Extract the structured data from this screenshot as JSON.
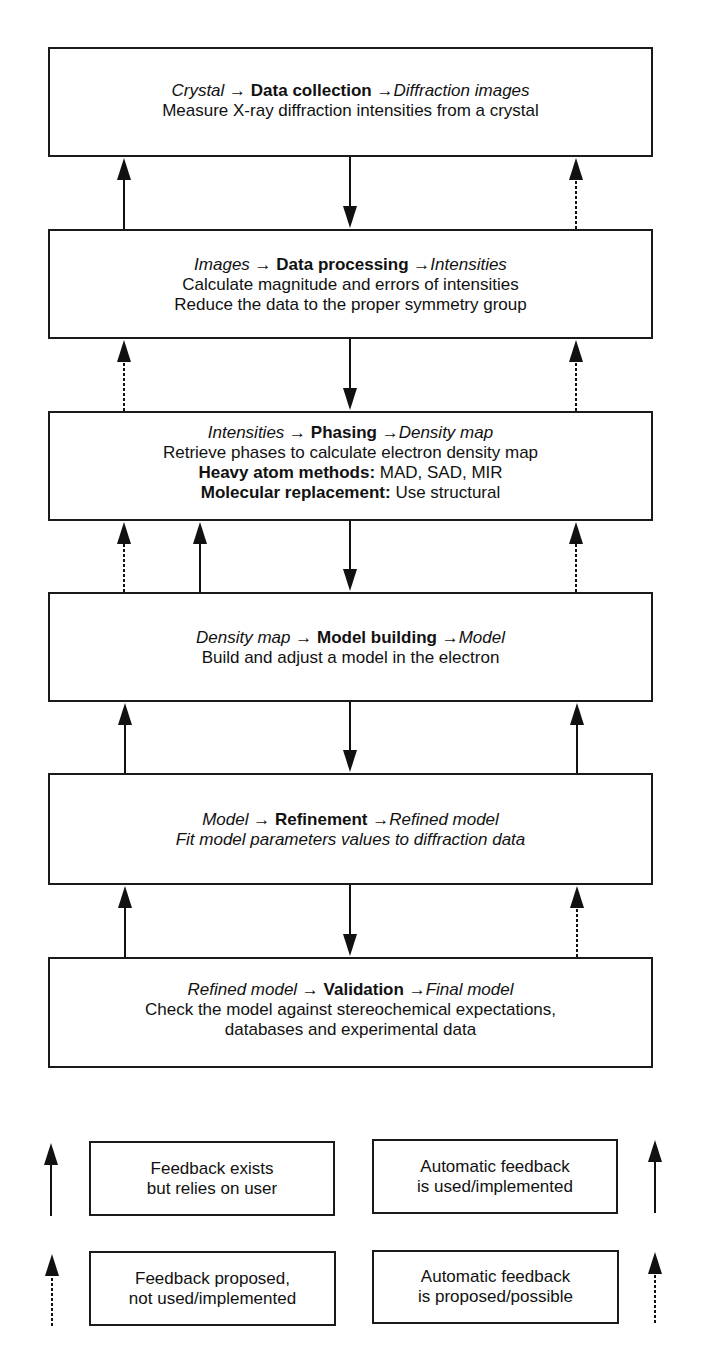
{
  "stages": [
    {
      "input": "Crystal",
      "name": "Data collection",
      "output": "Diffraction images",
      "arrow": "→",
      "lines": [
        {
          "text": "Measure X-ray diffraction intensities from a crystal",
          "style": "normal"
        }
      ]
    },
    {
      "input": "Images",
      "name": "Data processing",
      "output": "Intensities",
      "arrow": "→",
      "lines": [
        {
          "text": "Calculate magnitude and errors of intensities",
          "style": "normal"
        },
        {
          "text": "Reduce the data to the proper symmetry group",
          "style": "normal"
        }
      ]
    },
    {
      "input": "Intensities",
      "name": "Phasing",
      "output": "Density map",
      "arrow": "→",
      "lines": [
        {
          "text": "Retrieve phases to calculate electron density map",
          "style": "normal"
        },
        {
          "label": "Heavy atom methods:",
          "text": " MAD, SAD, MIR",
          "style": "labeled"
        },
        {
          "label": "Molecular replacement:",
          "text": " Use structural",
          "style": "labeled"
        }
      ]
    },
    {
      "input": "Density map",
      "name": "Model building",
      "output": "Model",
      "arrow": "→",
      "lines": [
        {
          "text": "Build and adjust a model in the electron",
          "style": "normal"
        }
      ]
    },
    {
      "input": "Model",
      "name": "Refinement",
      "output": "Refined model",
      "arrow": "→",
      "lines": [
        {
          "text": "Fit model parameters values to diffraction data",
          "style": "italic"
        }
      ]
    },
    {
      "input": "Refined model",
      "name": "Validation",
      "output": "Final model",
      "arrow": "→",
      "lines": [
        {
          "text": "Check the model against stereochemical expectations,",
          "style": "normal"
        },
        {
          "text": "databases and experimental data",
          "style": "normal"
        }
      ]
    }
  ],
  "feedback_arrows": [
    {
      "from": "Data processing",
      "to": "Data collection",
      "side": "left",
      "type": "solid",
      "meaning": "Feedback exists but relies on user"
    },
    {
      "from": "Data processing",
      "to": "Data collection",
      "side": "right",
      "type": "dotted",
      "meaning": "Automatic feedback is proposed/possible"
    },
    {
      "from": "Phasing",
      "to": "Data processing",
      "side": "left",
      "type": "dotted",
      "meaning": "Feedback proposed, not used/implemented"
    },
    {
      "from": "Phasing",
      "to": "Data processing",
      "side": "right",
      "type": "dotted",
      "meaning": "Automatic feedback is proposed/possible"
    },
    {
      "from": "Model building",
      "to": "Phasing",
      "side": "left",
      "type": "dotted",
      "meaning": "Feedback proposed, not used/implemented"
    },
    {
      "from": "Model building",
      "to": "Phasing",
      "side": "left-inner",
      "type": "solid",
      "meaning": "Feedback exists but relies on user"
    },
    {
      "from": "Model building",
      "to": "Phasing",
      "side": "right",
      "type": "dotted",
      "meaning": "Automatic feedback is proposed/possible"
    },
    {
      "from": "Refinement",
      "to": "Model building",
      "side": "left",
      "type": "solid",
      "meaning": "Feedback exists but relies on user"
    },
    {
      "from": "Refinement",
      "to": "Model building",
      "side": "right",
      "type": "solid",
      "meaning": "Automatic feedback is used/implemented"
    },
    {
      "from": "Validation",
      "to": "Refinement",
      "side": "left",
      "type": "solid",
      "meaning": "Feedback exists but relies on user"
    },
    {
      "from": "Validation",
      "to": "Refinement",
      "side": "right",
      "type": "dotted",
      "meaning": "Automatic feedback is proposed/possible"
    }
  ],
  "legend": {
    "items": [
      {
        "id": "user-feedback",
        "line1": "Feedback exists",
        "line2": "but relies on user",
        "arrow_type": "solid",
        "arrow_side": "left"
      },
      {
        "id": "auto-used",
        "line1": "Automatic feedback",
        "line2": "is used/implemented",
        "arrow_type": "solid",
        "arrow_side": "right"
      },
      {
        "id": "proposed",
        "line1": "Feedback proposed,",
        "line2": "not used/implemented",
        "arrow_type": "dotted",
        "arrow_side": "left"
      },
      {
        "id": "auto-proposed",
        "line1": "Automatic feedback",
        "line2": "is proposed/possible",
        "arrow_type": "dotted",
        "arrow_side": "right"
      }
    ]
  },
  "colors": {
    "stroke": "#1a1a1a",
    "background": "#ffffff",
    "text": "#111111"
  }
}
